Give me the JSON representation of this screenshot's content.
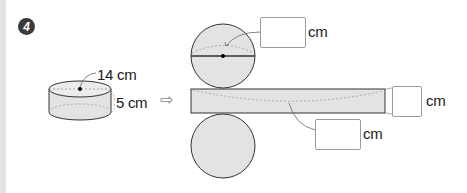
{
  "problem": {
    "number": "4"
  },
  "cylinder": {
    "diameter_label": "14 cm",
    "height_label": "5 cm"
  },
  "net": {
    "arrow": "⇨",
    "top_circle_box_unit": "cm",
    "rect_height_box_unit": "cm",
    "rect_length_box_unit": "cm"
  },
  "colors": {
    "shape_fill": "#e3e3e3",
    "stroke": "#333333",
    "dashed": "#999999",
    "box_border": "#9a9a9a"
  }
}
